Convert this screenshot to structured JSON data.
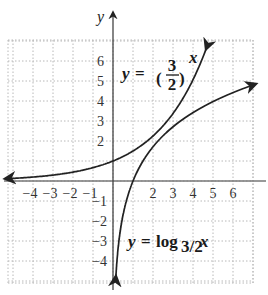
{
  "chart_data": {
    "type": "line",
    "title": "",
    "xlabel": "x",
    "ylabel": "y",
    "xlim": [
      -5,
      7
    ],
    "ylim": [
      -5,
      7
    ],
    "grid": true,
    "grid_style": "dotted",
    "x_ticks": [
      "-4",
      "-3",
      "-2",
      "-1",
      "2",
      "3",
      "4",
      "5",
      "6"
    ],
    "y_ticks": [
      "6",
      "5",
      "4",
      "3",
      "2",
      "1",
      "-1",
      "-2",
      "-3",
      "-4"
    ],
    "y_ticks_positive": [
      "6",
      "5",
      "4",
      "3",
      "2"
    ],
    "y_ticks_negative": [
      "-1",
      "-2",
      "-3",
      "-4"
    ],
    "series": [
      {
        "name": "y = (3/2)^x",
        "function": "exponential",
        "x": [
          -5,
          -4,
          -3,
          -2,
          -1,
          0,
          1,
          2,
          3,
          4,
          4.6
        ],
        "y": [
          0.13,
          0.2,
          0.3,
          0.44,
          0.67,
          1,
          1.5,
          2.25,
          3.38,
          5.06,
          6.45
        ]
      },
      {
        "name": "y = log_{3/2} x",
        "function": "logarithm",
        "x": [
          0.15,
          0.2,
          0.3,
          0.44,
          0.67,
          1,
          1.5,
          2.25,
          3.38,
          5.06,
          7
        ],
        "y": [
          -4.68,
          -3.97,
          -2.97,
          -2.02,
          -0.99,
          0,
          1,
          2,
          3,
          4,
          4.8
        ]
      }
    ],
    "annotations": [
      {
        "text_prefix": "y = ",
        "base_num": "3",
        "base_den": "2",
        "exponent": "x",
        "near": "upper middle"
      },
      {
        "text_prefix": "y = log",
        "subscript": "3/2",
        "argument": "x",
        "near": "lower right"
      }
    ]
  },
  "labels": {
    "x_axis": "x",
    "y_axis": "y",
    "exp_eq": {
      "lhs": "y",
      "equals": "=",
      "num": "3",
      "den": "2",
      "exp": "x"
    },
    "log_eq": {
      "lhs": "y",
      "equals": "=",
      "fn": "log",
      "sub": "3/2",
      "arg": "x"
    }
  }
}
